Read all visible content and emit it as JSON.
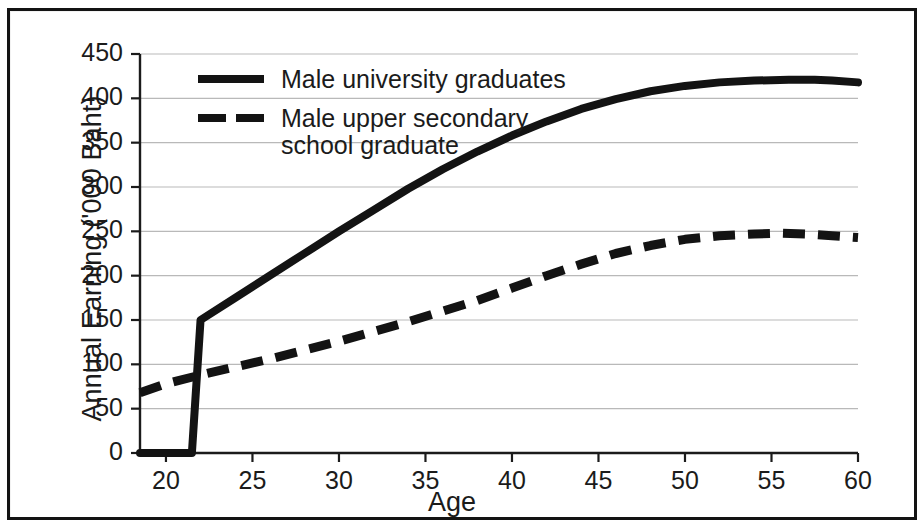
{
  "chart_data": {
    "type": "line",
    "title": "",
    "xlabel": "Age",
    "ylabel": "Annual Earning ('000 Baht)",
    "xlim": [
      18.5,
      60
    ],
    "ylim": [
      0,
      450
    ],
    "xticks": [
      "20",
      "25",
      "30",
      "35",
      "40",
      "45",
      "50",
      "55",
      "60"
    ],
    "xtick_values": [
      20,
      25,
      30,
      35,
      40,
      45,
      50,
      55,
      60
    ],
    "yticks": [
      "0",
      "50",
      "100",
      "150",
      "200",
      "250",
      "300",
      "350",
      "400",
      "450"
    ],
    "ytick_values": [
      0,
      50,
      100,
      150,
      200,
      250,
      300,
      350,
      400,
      450
    ],
    "grid": true,
    "grid_axis": "y",
    "legend_position": "upper left inside",
    "line_color": "#131313",
    "grid_color": "#b9b9b9",
    "axis_color": "#1b1b1b",
    "series": [
      {
        "name": "Male university graduates",
        "style": "solid",
        "x": [
          18.5,
          21.4,
          21.5,
          22,
          24,
          26,
          28,
          30,
          32,
          34,
          36,
          38,
          40,
          42,
          44,
          46,
          48,
          50,
          52,
          54,
          56,
          57.5,
          58.5,
          60
        ],
        "values": [
          0,
          0,
          0,
          150,
          175,
          200,
          225,
          250,
          274,
          298,
          320,
          340,
          358,
          374,
          388,
          399,
          408,
          414,
          418,
          420,
          421,
          421,
          420,
          418
        ]
      },
      {
        "name": "Male upper secondary\nschool graduate",
        "style": "dashed",
        "x": [
          18.5,
          20,
          22,
          24,
          26,
          28,
          30,
          32,
          34,
          36,
          38,
          40,
          42,
          44,
          46,
          48,
          50,
          52,
          54,
          55.5,
          57,
          58.5,
          60
        ],
        "values": [
          68,
          78,
          88,
          97,
          106,
          116,
          126,
          137,
          148,
          160,
          172,
          186,
          200,
          213,
          225,
          234,
          241,
          245,
          247,
          248,
          247,
          245,
          243
        ]
      }
    ]
  },
  "axes": {
    "y_title": "Annual Earning ('000 Baht)",
    "x_title": "Age"
  },
  "legend": {
    "items": [
      {
        "label": "Male university graduates",
        "style": "solid"
      },
      {
        "label": "Male upper secondary\nschool graduate",
        "style": "dashed"
      }
    ]
  }
}
